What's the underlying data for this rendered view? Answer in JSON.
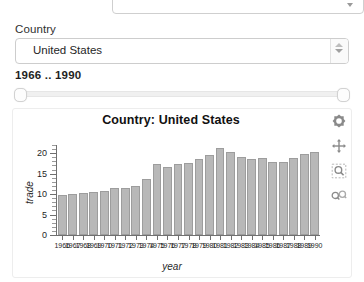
{
  "top_partial_field": {
    "name": "cut-off-select",
    "caret_icon": "chevron-down-icon"
  },
  "country_field": {
    "label": "Country",
    "value": "United States",
    "placeholder": "Select a country",
    "caret_icon": "chevron-updown-icon"
  },
  "year_range": {
    "readout": "1966 .. 1990",
    "min_label": "1966",
    "max_label": "1990",
    "handle_left": "range-handle-min",
    "handle_right": "range-handle-max"
  },
  "modebar": {
    "buttons": [
      {
        "name": "reset-axes-icon",
        "title": "Reset axes"
      },
      {
        "name": "pan-icon",
        "title": "Pan"
      },
      {
        "name": "zoom-box-icon",
        "title": "Box zoom"
      },
      {
        "name": "zoom-in-out-icon",
        "title": "Zoom"
      }
    ]
  },
  "chart_data": {
    "type": "bar",
    "title": "Country: United States",
    "xlabel": "year",
    "ylabel": "trade",
    "ylim": [
      0,
      22
    ],
    "yticks": [
      0,
      5,
      10,
      15,
      20
    ],
    "grid": false,
    "legend": "none",
    "bar_color": "#b8b8b8",
    "categories": [
      "1966",
      "1967",
      "1968",
      "1969",
      "1970",
      "1971",
      "1972",
      "1973",
      "1974",
      "1975",
      "1976",
      "1977",
      "1978",
      "1979",
      "1980",
      "1981",
      "1982",
      "1983",
      "1984",
      "1985",
      "1986",
      "1987",
      "1988",
      "1989",
      "1990"
    ],
    "values": [
      9.7,
      10.1,
      10.2,
      10.6,
      10.7,
      11.5,
      11.4,
      12.0,
      13.8,
      17.4,
      16.6,
      17.3,
      17.5,
      18.5,
      19.6,
      21.2,
      20.4,
      19.1,
      18.6,
      18.8,
      17.9,
      17.9,
      18.9,
      19.8,
      20.3
    ]
  }
}
